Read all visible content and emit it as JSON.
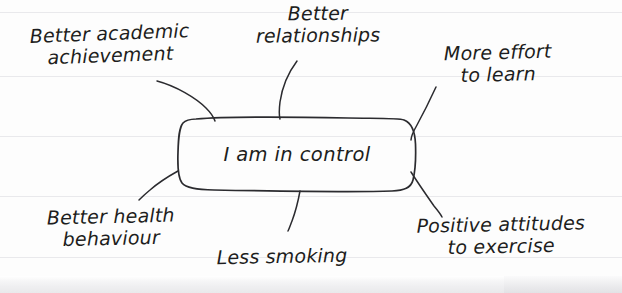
{
  "page": {
    "medium": "lined-paper",
    "ink_color": "#2b2b2f",
    "paper_color": "#fdfdfd",
    "rule_line_color": "#e9e9ec"
  },
  "diagram": {
    "type": "mind-map",
    "central_node": {
      "label": "I am in control",
      "shape": "rounded-rectangle"
    },
    "branches": [
      {
        "label": "Better academic\nachievement",
        "position": "top-left"
      },
      {
        "label": "Better\nrelationships",
        "position": "top-center"
      },
      {
        "label": "More effort\nto learn",
        "position": "top-right"
      },
      {
        "label": "Better health\nbehaviour",
        "position": "bottom-left"
      },
      {
        "label": "Less smoking",
        "position": "bottom-center"
      },
      {
        "label": "Positive attitudes\nto exercise",
        "position": "bottom-right"
      }
    ]
  }
}
